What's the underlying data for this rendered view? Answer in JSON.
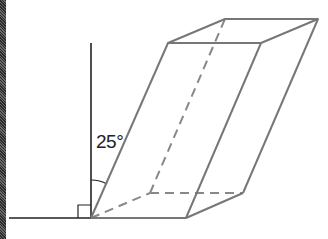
{
  "figure": {
    "type": "oblique-prism-diagram",
    "angle_label": "25°",
    "angle_degrees": 25,
    "right_angle_marker": true,
    "colors": {
      "axis_lines": "#222222",
      "prism_edges": "#777777",
      "hidden_edges": "#888888",
      "border": "#3a3a3a"
    },
    "vertical_line": {
      "x": 91,
      "y1": 43,
      "y2": 218
    },
    "ground_line": {
      "x1": 9,
      "x2": 186,
      "y": 218
    },
    "prism_vertices": {
      "front_bottom_left": [
        91,
        218
      ],
      "front_bottom_right": [
        186,
        218
      ],
      "back_bottom_left": [
        150,
        193
      ],
      "back_bottom_right": [
        243,
        193
      ],
      "front_top_left": [
        168,
        43
      ],
      "front_top_right": [
        261,
        43
      ],
      "back_top_left": [
        225,
        19
      ],
      "back_top_right": [
        318,
        19
      ]
    },
    "hidden_edges": [
      "front_bottom_left-back_bottom_left",
      "back_bottom_left-back_bottom_right",
      "back_bottom_left-back_top_left"
    ]
  }
}
